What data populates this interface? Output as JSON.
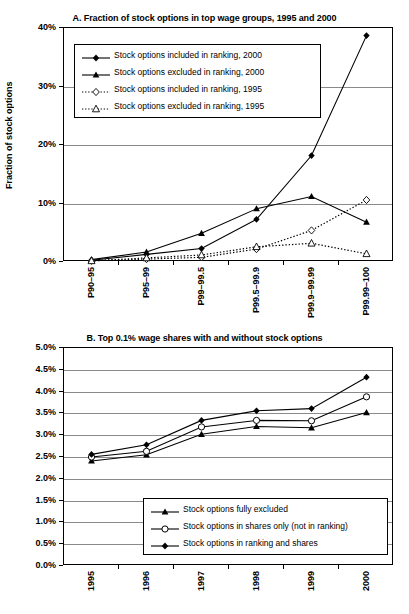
{
  "figure": {
    "panel_a_title": "A. Fraction of stock options in top wage groups, 1995 and 2000",
    "panel_b_title": "B. Top 0.1% wage shares with and without stock options"
  },
  "chart_data": [
    {
      "id": "panel_a",
      "type": "line",
      "title": "A. Fraction of stock options in top wage groups, 1995 and 2000",
      "xlabel": "",
      "ylabel": "Fraction of stock options",
      "grid": true,
      "legend_position": "upper-left-inside",
      "categories": [
        "P90–95",
        "P95–99",
        "P99–99.5",
        "P99.5–99.9",
        "P99.9–99.99",
        "P99.99–100"
      ],
      "ylim": [
        0,
        40
      ],
      "ytick_labels": [
        "40%",
        "30%",
        "20%",
        "10%",
        "0%"
      ],
      "ytick_values": [
        40,
        30,
        20,
        10,
        0
      ],
      "series": [
        {
          "name": "Stock options included in ranking, 2000",
          "marker": "filled-diamond",
          "line": "solid",
          "values": [
            0.3,
            1.3,
            2.3,
            7.3,
            18.2,
            38.7
          ]
        },
        {
          "name": "Stock options excluded in ranking, 2000",
          "marker": "filled-triangle",
          "line": "solid",
          "values": [
            0.4,
            1.7,
            4.9,
            9.1,
            11.2,
            6.8
          ]
        },
        {
          "name": "Stock options included in ranking, 1995",
          "marker": "open-diamond",
          "line": "dotted",
          "values": [
            0.2,
            0.5,
            0.8,
            2.2,
            5.4,
            10.6
          ]
        },
        {
          "name": "Stock options excluded in ranking, 1995",
          "marker": "open-triangle",
          "line": "dotted",
          "values": [
            0.2,
            0.7,
            1.2,
            2.6,
            3.2,
            1.4
          ]
        }
      ]
    },
    {
      "id": "panel_b",
      "type": "line",
      "title": "B. Top 0.1% wage shares with and without stock options",
      "xlabel": "",
      "ylabel": "",
      "grid": true,
      "legend_position": "lower-center-inside",
      "categories": [
        "1995",
        "1996",
        "1997",
        "1998",
        "1999",
        "2000"
      ],
      "ylim": [
        0,
        5
      ],
      "ytick_labels": [
        "5.0%",
        "4.5%",
        "4.0%",
        "3.5%",
        "3.0%",
        "2.5%",
        "2.0%",
        "1.5%",
        "1.0%",
        "0.5%",
        "0.0%"
      ],
      "ytick_values": [
        5.0,
        4.5,
        4.0,
        3.5,
        3.0,
        2.5,
        2.0,
        1.5,
        1.0,
        0.5,
        0.0
      ],
      "series": [
        {
          "name": "Stock options fully excluded",
          "marker": "filled-triangle",
          "line": "solid",
          "values": [
            2.41,
            2.55,
            3.02,
            3.2,
            3.17,
            3.52
          ]
        },
        {
          "name": "Stock options in shares only (not in ranking)",
          "marker": "open-circle",
          "line": "solid",
          "values": [
            2.5,
            2.63,
            3.19,
            3.34,
            3.33,
            3.88
          ]
        },
        {
          "name": "Stock options in ranking and shares",
          "marker": "filled-diamond",
          "line": "solid",
          "values": [
            2.56,
            2.78,
            3.34,
            3.56,
            3.61,
            4.33
          ]
        }
      ]
    }
  ],
  "colors": {
    "line": "#000000",
    "grid": "#8a8a8a",
    "axis": "#000000",
    "background": "#ffffff"
  }
}
